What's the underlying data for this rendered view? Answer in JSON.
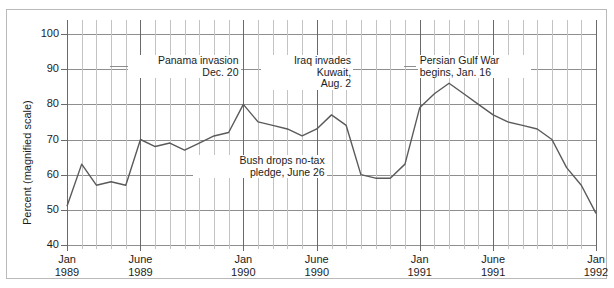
{
  "figure": {
    "cut_off_headline": "",
    "border_color": "#b9b9b9",
    "line_color": "#5a5a5a",
    "grid_color": "#c3c3c3",
    "grid_major_color": "#6a6a6a"
  },
  "axes": {
    "y_title": "Percent (magnified scale)",
    "y_ticks": [
      "100",
      "90",
      "80",
      "70",
      "60",
      "50",
      "40"
    ],
    "x_ticks": [
      {
        "line1": "Jan",
        "line2": "1989",
        "index": 0
      },
      {
        "line1": "June",
        "line2": "1989",
        "index": 5
      },
      {
        "line1": "Jan",
        "line2": "1990",
        "index": 12
      },
      {
        "line1": "June",
        "line2": "1990",
        "index": 17
      },
      {
        "line1": "Jan",
        "line2": "1991",
        "index": 24
      },
      {
        "line1": "June",
        "line2": "1991",
        "index": 29
      },
      {
        "line1": "Jan",
        "line2": "1992",
        "index": 36
      }
    ]
  },
  "annotations": [
    {
      "id": "panama",
      "line1": "Panama invasion",
      "line2": "Dec. 20"
    },
    {
      "id": "iraq",
      "line1": "Iraq invades",
      "line2": "Kuwait,",
      "line3": "Aug. 2"
    },
    {
      "id": "gulfwar",
      "line1": "Persian Gulf War",
      "line2": "begins, Jan. 16"
    },
    {
      "id": "notax",
      "line1": "Bush drops no-tax",
      "line2": "pledge, June 26"
    }
  ],
  "chart_data": {
    "type": "line",
    "title": "",
    "xlabel": "",
    "ylabel": "Percent (magnified scale)",
    "ylim": [
      40,
      100
    ],
    "grid": true,
    "legend": "none",
    "x": [
      "Jan 1989",
      "Feb 1989",
      "Mar 1989",
      "Apr 1989",
      "May 1989",
      "June 1989",
      "July 1989",
      "Aug 1989",
      "Sept 1989",
      "Oct 1989",
      "Nov 1989",
      "Dec 1989",
      "Jan 1990",
      "Feb 1990",
      "Mar 1990",
      "Apr 1990",
      "May 1990",
      "June 1990",
      "July 1990",
      "Aug 1990",
      "Sept 1990",
      "Oct 1990",
      "Nov 1990",
      "Dec 1990",
      "Jan 1991",
      "Feb 1991",
      "Mar 1991",
      "Apr 1991",
      "May 1991",
      "June 1991",
      "July 1991",
      "Aug 1991",
      "Sept 1991",
      "Oct 1991",
      "Nov 1991",
      "Dec 1991",
      "Jan 1992"
    ],
    "values": [
      51,
      63,
      57,
      58,
      57,
      70,
      68,
      69,
      67,
      69,
      71,
      72,
      80,
      75,
      74,
      73,
      71,
      73,
      77,
      74,
      60,
      59,
      59,
      63,
      79,
      83,
      86,
      83,
      80,
      77,
      75,
      74,
      73,
      70,
      62,
      57,
      49
    ],
    "series": [
      {
        "name": "Presidential approval",
        "values": [
          51,
          63,
          57,
          58,
          57,
          70,
          68,
          69,
          67,
          69,
          71,
          72,
          80,
          75,
          74,
          73,
          71,
          73,
          77,
          74,
          60,
          59,
          59,
          63,
          79,
          83,
          86,
          83,
          80,
          77,
          75,
          74,
          73,
          70,
          62,
          57,
          49
        ]
      }
    ],
    "event_markers": [
      {
        "label": "Panama invasion Dec. 20",
        "x": "Dec 1989"
      },
      {
        "label": "Bush drops no-tax pledge, June 26",
        "x": "June 1990"
      },
      {
        "label": "Iraq invades Kuwait, Aug. 2",
        "x": "Aug 1990"
      },
      {
        "label": "Persian Gulf War begins, Jan. 16",
        "x": "Jan 1991"
      }
    ]
  }
}
